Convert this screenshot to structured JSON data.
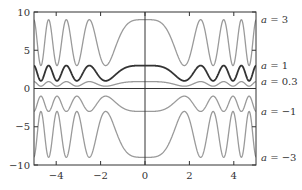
{
  "chart_data": {
    "type": "line",
    "title": "",
    "xlabel": "",
    "ylabel": "",
    "function": "y = a * (2 + cos(x^2))",
    "xlim": [
      -5,
      5
    ],
    "ylim": [
      -10,
      10
    ],
    "grid": false,
    "x_ticks": [
      -4,
      -2,
      0,
      2,
      4
    ],
    "x_tick_labels": [
      "−4",
      "−2",
      "0",
      "2",
      "4"
    ],
    "y_ticks": [
      -10,
      -5,
      0,
      5,
      10
    ],
    "y_tick_labels": [
      "−10",
      "−5",
      "0",
      "5",
      "10"
    ],
    "legend_position": "right, inline labels",
    "series": [
      {
        "name": "a = 3",
        "a": 3,
        "color": "#9a9a9a",
        "width": 1.3,
        "label_var": "a",
        "label_val": "3"
      },
      {
        "name": "a = 1",
        "a": 1,
        "color": "#333333",
        "width": 1.8,
        "label_var": "a",
        "label_val": "1"
      },
      {
        "name": "a = 0.3",
        "a": 0.3,
        "color": "#9a9a9a",
        "width": 1.3,
        "label_var": "a",
        "label_val": "0.3"
      },
      {
        "name": "a = −1",
        "a": -1,
        "color": "#9a9a9a",
        "width": 1.3,
        "label_var": "a",
        "label_val": "−1"
      },
      {
        "name": "a = −3",
        "a": -3,
        "color": "#9a9a9a",
        "width": 1.3,
        "label_var": "a",
        "label_val": "−3"
      }
    ],
    "sample_points": {
      "x": [
        -5,
        -4.69,
        -4.34,
        -3.96,
        -3.54,
        -3.07,
        -2.51,
        -1.77,
        0,
        1.77,
        2.51,
        3.07,
        3.54,
        3.96,
        4.34,
        4.69,
        5
      ],
      "note": "extrema of cos(x^2): minima at x=±√π,±√3π,±√5π,±√7π; maxima at 0, ±√2π, ±√4π, ±√6π"
    },
    "label_y": [
      9,
      3,
      0.9,
      -3,
      -9
    ]
  },
  "frame": {
    "left": 34,
    "right": 256,
    "top": 12,
    "bottom": 165,
    "axis_color": "#333333",
    "curve_gray": "#9a9a9a",
    "curve_dark": "#333333"
  }
}
